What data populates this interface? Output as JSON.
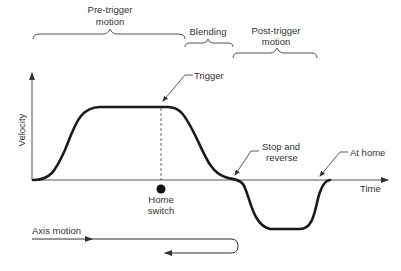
{
  "labels": {
    "pre_trigger": [
      "Pre-trigger",
      "motion"
    ],
    "blending": "Blending",
    "post_trigger": [
      "Post-trigger",
      "motion"
    ],
    "trigger": "Trigger",
    "stop_and_reverse": [
      "Stop and",
      "reverse"
    ],
    "at_home": "At home",
    "velocity_axis": "Velocity",
    "time_axis": "Time",
    "home_switch": [
      "Home",
      "switch"
    ],
    "axis_motion": "Axis motion"
  },
  "colors": {
    "curve": "#1a1a1a",
    "axis": "#555555",
    "text": "#333333"
  }
}
